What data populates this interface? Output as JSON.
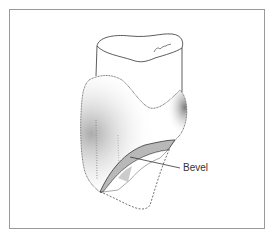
{
  "figure": {
    "labels": [
      {
        "text": "Bevel",
        "target": "bevel"
      }
    ],
    "colors": {
      "line": "#333333",
      "bevel_fill": "#b8b8b8",
      "frame": "#9a9a9a"
    }
  }
}
